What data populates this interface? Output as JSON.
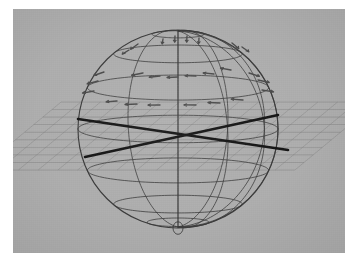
{
  "figure": {
    "caption": "",
    "background_color": "#aeaeae",
    "panel": {
      "x": 13,
      "y": 9,
      "width": 332,
      "height": 244
    },
    "page_color": "#ffffff"
  },
  "colors": {
    "background": "#aeaeae",
    "sphere_line": "#3a3a3a",
    "grid_plane_line": "#7d7d7d",
    "axis_line": "#141414",
    "marker": "#4a4a4a",
    "page": "#ffffff"
  },
  "chart_data": {
    "type": "scatter",
    "xlabel": "",
    "ylabel": "",
    "projection": "orthographic-3d",
    "sphere": {
      "center_x": 178,
      "center_y": 129,
      "radius_x": 100,
      "radius_y": 99,
      "tilt_deg": 8,
      "meridian_count": 8,
      "parallel_count": 7,
      "meridian_longitudes_deg": [
        0,
        30,
        60,
        90,
        120,
        150,
        180,
        210
      ],
      "parallel_latitudes_deg": [
        75,
        50,
        25,
        0,
        -25,
        -50,
        -72
      ],
      "pole_cusp_radius": 5
    },
    "plane": {
      "label": "horizontal reference grid plane",
      "mesh_rows": 9,
      "mesh_cols": 16,
      "half_width": 158,
      "half_depth": 34,
      "center_y": 136,
      "style": "rhombus-mesh"
    },
    "axes_overlay": {
      "line_width": 2.6,
      "segments": [
        {
          "name": "axis-line-a",
          "x1": 78,
          "y1": 119,
          "x2": 288,
          "y2": 150
        },
        {
          "name": "axis-line-b",
          "x1": 85,
          "y1": 157,
          "x2": 278,
          "y2": 115
        }
      ]
    },
    "markers": {
      "label": "surface vector arrows on upper hemisphere",
      "count": 26,
      "style": "short-arrow",
      "items": [
        {
          "x": 175,
          "y": 36,
          "angle": 92,
          "len": 11
        },
        {
          "x": 187,
          "y": 36,
          "angle": 92,
          "len": 11
        },
        {
          "x": 199,
          "y": 38,
          "angle": 92,
          "len": 10
        },
        {
          "x": 163,
          "y": 39,
          "angle": 95,
          "len": 9
        },
        {
          "x": 138,
          "y": 44,
          "angle": 128,
          "len": 12
        },
        {
          "x": 129,
          "y": 50,
          "angle": 132,
          "len": 10
        },
        {
          "x": 232,
          "y": 43,
          "angle": 56,
          "len": 12
        },
        {
          "x": 242,
          "y": 47,
          "angle": 52,
          "len": 11
        },
        {
          "x": 143,
          "y": 73,
          "angle": 160,
          "len": 12
        },
        {
          "x": 160,
          "y": 76,
          "angle": 168,
          "len": 11
        },
        {
          "x": 178,
          "y": 77,
          "angle": 175,
          "len": 11
        },
        {
          "x": 196,
          "y": 76,
          "angle": 183,
          "len": 11
        },
        {
          "x": 214,
          "y": 74,
          "angle": 190,
          "len": 11
        },
        {
          "x": 231,
          "y": 70,
          "angle": 198,
          "len": 11
        },
        {
          "x": 104,
          "y": 72,
          "angle": 148,
          "len": 12
        },
        {
          "x": 98,
          "y": 81,
          "angle": 155,
          "len": 12
        },
        {
          "x": 94,
          "y": 91,
          "angle": 162,
          "len": 12
        },
        {
          "x": 249,
          "y": 73,
          "angle": 30,
          "len": 12
        },
        {
          "x": 258,
          "y": 80,
          "angle": 22,
          "len": 12
        },
        {
          "x": 262,
          "y": 90,
          "angle": 16,
          "len": 12
        },
        {
          "x": 117,
          "y": 101,
          "angle": 172,
          "len": 11
        },
        {
          "x": 137,
          "y": 104,
          "angle": 176,
          "len": 12
        },
        {
          "x": 160,
          "y": 105,
          "angle": 179,
          "len": 12
        },
        {
          "x": 196,
          "y": 105,
          "angle": 181,
          "len": 12
        },
        {
          "x": 220,
          "y": 103,
          "angle": 184,
          "len": 12
        },
        {
          "x": 243,
          "y": 100,
          "angle": 188,
          "len": 12
        }
      ]
    }
  }
}
